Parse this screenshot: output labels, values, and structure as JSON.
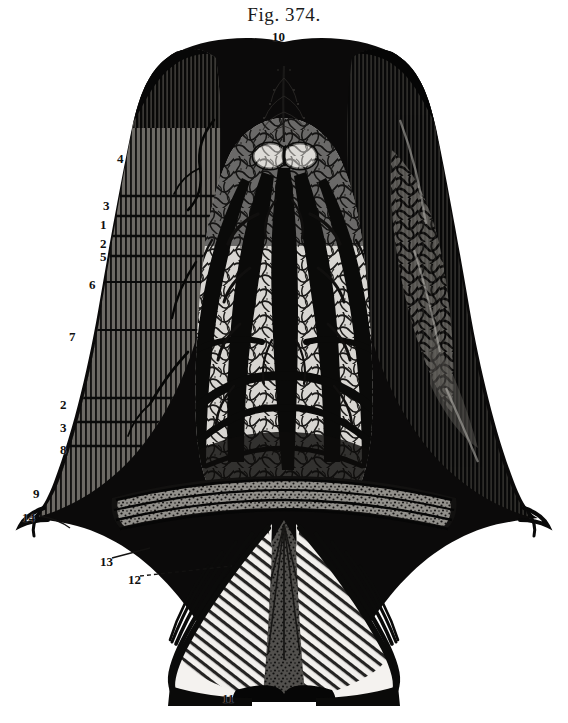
{
  "figure": {
    "caption": "Fig. 374.",
    "background_color": "#ffffff",
    "ink_color": "#111111",
    "width": 568,
    "height": 723
  },
  "labels": [
    {
      "id": "label-10",
      "text": "10",
      "x": 272,
      "y": 30
    },
    {
      "id": "label-4",
      "text": "4",
      "x": 117,
      "y": 152
    },
    {
      "id": "label-3a",
      "text": "3",
      "x": 103,
      "y": 199
    },
    {
      "id": "label-1",
      "text": "1",
      "x": 100,
      "y": 218
    },
    {
      "id": "label-2a",
      "text": "2",
      "x": 100,
      "y": 237
    },
    {
      "id": "label-5",
      "text": "5",
      "x": 100,
      "y": 250
    },
    {
      "id": "label-6",
      "text": "6",
      "x": 89,
      "y": 278
    },
    {
      "id": "label-7",
      "text": "7",
      "x": 69,
      "y": 330
    },
    {
      "id": "label-2b",
      "text": "2",
      "x": 60,
      "y": 398
    },
    {
      "id": "label-3b",
      "text": "3",
      "x": 60,
      "y": 421
    },
    {
      "id": "label-8",
      "text": "8",
      "x": 60,
      "y": 443
    },
    {
      "id": "label-9",
      "text": "9",
      "x": 33,
      "y": 487
    },
    {
      "id": "label-14",
      "text": "14",
      "x": 22,
      "y": 511
    },
    {
      "id": "label-13",
      "text": "13",
      "x": 100,
      "y": 555
    },
    {
      "id": "label-12",
      "text": "12",
      "x": 128,
      "y": 573
    },
    {
      "id": "label-11",
      "text": "11",
      "x": 222,
      "y": 692
    }
  ]
}
